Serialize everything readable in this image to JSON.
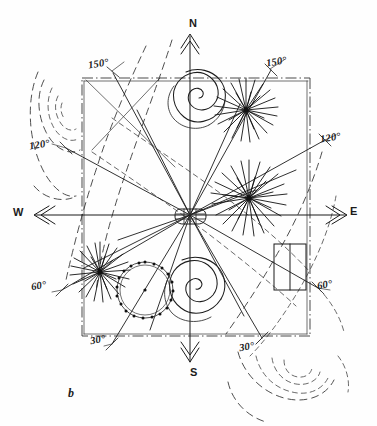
{
  "figure": {
    "caption": "b",
    "type": "hand-drawn survey layout sketch",
    "cardinal_points": [
      {
        "name": "north",
        "label": "N"
      },
      {
        "name": "south",
        "label": "S"
      },
      {
        "name": "east",
        "label": "E"
      },
      {
        "name": "west",
        "label": "W"
      }
    ],
    "angle_labels": [
      {
        "name": "angle-150-left",
        "label": "150°"
      },
      {
        "name": "angle-150-right",
        "label": "150°"
      },
      {
        "name": "angle-120-left",
        "label": "120°"
      },
      {
        "name": "angle-120-right",
        "label": "120°"
      },
      {
        "name": "angle-60-left",
        "label": "60°"
      },
      {
        "name": "angle-60-right",
        "label": "60°"
      },
      {
        "name": "angle-30-left",
        "label": "30°"
      },
      {
        "name": "angle-30-right",
        "label": "30°"
      }
    ],
    "colors": {
      "ink": "#1b1b1b",
      "ink_light": "#4a4a4a",
      "paper": "#fefefe"
    }
  }
}
